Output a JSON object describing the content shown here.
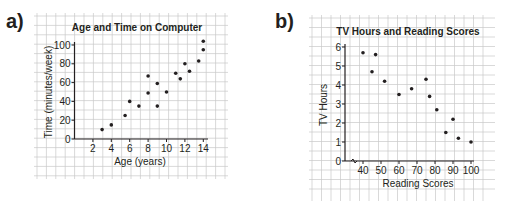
{
  "chart_data": [
    {
      "panel": "a)",
      "type": "scatter",
      "title": "Age and Time on Computer",
      "xlabel": "Age (years)",
      "ylabel": "Time (minutes/week)",
      "xticks": [
        2,
        4,
        6,
        8,
        10,
        12,
        14
      ],
      "yticks": [
        0,
        20,
        40,
        60,
        80,
        100
      ],
      "xlim": [
        0,
        14.5
      ],
      "ylim": [
        0,
        105
      ],
      "grid": true,
      "points": [
        {
          "x": 3,
          "y": 10
        },
        {
          "x": 4,
          "y": 15
        },
        {
          "x": 5.5,
          "y": 25
        },
        {
          "x": 6,
          "y": 40
        },
        {
          "x": 7,
          "y": 35
        },
        {
          "x": 8,
          "y": 67
        },
        {
          "x": 8,
          "y": 49
        },
        {
          "x": 9,
          "y": 59
        },
        {
          "x": 9,
          "y": 35
        },
        {
          "x": 10,
          "y": 50
        },
        {
          "x": 11,
          "y": 70
        },
        {
          "x": 11.5,
          "y": 64
        },
        {
          "x": 12,
          "y": 80
        },
        {
          "x": 12.5,
          "y": 72
        },
        {
          "x": 13.5,
          "y": 83
        },
        {
          "x": 14,
          "y": 95
        },
        {
          "x": 14,
          "y": 104
        }
      ]
    },
    {
      "panel": "b)",
      "type": "scatter",
      "title": "TV Hours and Reading Scores",
      "xlabel": "Reading Scores",
      "ylabel": "TV Hours",
      "xticks": [
        40,
        50,
        60,
        70,
        80,
        90,
        100
      ],
      "yticks": [
        0,
        1,
        2,
        3,
        4,
        5,
        6
      ],
      "xlim": [
        30,
        101
      ],
      "ylim": [
        0,
        6.2
      ],
      "axis_break": "x",
      "grid": true,
      "points": [
        {
          "x": 40,
          "y": 5.7
        },
        {
          "x": 45,
          "y": 4.7
        },
        {
          "x": 47,
          "y": 5.6
        },
        {
          "x": 52,
          "y": 4.2
        },
        {
          "x": 60,
          "y": 3.5
        },
        {
          "x": 67,
          "y": 3.8
        },
        {
          "x": 75,
          "y": 4.3
        },
        {
          "x": 77,
          "y": 3.4
        },
        {
          "x": 81,
          "y": 2.7
        },
        {
          "x": 86,
          "y": 1.5
        },
        {
          "x": 90,
          "y": 2.2
        },
        {
          "x": 93,
          "y": 1.2
        },
        {
          "x": 100,
          "y": 1.0
        }
      ]
    }
  ]
}
